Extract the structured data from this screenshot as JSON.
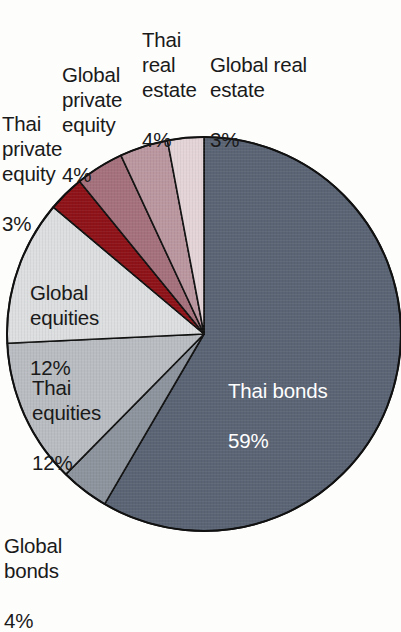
{
  "chart_data": {
    "type": "pie",
    "title": "",
    "subtitle": "",
    "xlabel": "",
    "ylabel": "",
    "legend_position": "none",
    "grid": false,
    "value_unit": "%",
    "start_angle_deg": 0,
    "direction": "clockwise",
    "categories": [
      "Thai bonds",
      "Global bonds",
      "Thai equities",
      "Global equities",
      "Thai private equity",
      "Global private equity",
      "Thai real estate",
      "Global real estate"
    ],
    "values": [
      59,
      4,
      12,
      12,
      3,
      4,
      4,
      3
    ],
    "colors": [
      "#5a6474",
      "#8d949d",
      "#b9bdc1",
      "#dcdedf",
      "#8e1318",
      "#a5717c",
      "#bb97a0",
      "#e4d4d8"
    ],
    "slices": [
      {
        "label": "Thai bonds",
        "value": 59,
        "value_text": "59%",
        "color": "#5a6474"
      },
      {
        "label": "Global bonds",
        "value": 4,
        "value_text": "4%",
        "color": "#8d949d"
      },
      {
        "label": "Thai equities",
        "value": 12,
        "value_text": "12%",
        "color": "#b9bdc1"
      },
      {
        "label": "Global equities",
        "value": 12,
        "value_text": "12%",
        "color": "#dcdedf"
      },
      {
        "label": "Thai private equity",
        "value": 3,
        "value_text": "3%",
        "color": "#8e1318"
      },
      {
        "label": "Global private equity",
        "value": 4,
        "value_text": "4%",
        "color": "#a5717c"
      },
      {
        "label": "Thai real estate",
        "value": 4,
        "value_text": "4%",
        "color": "#bb97a0"
      },
      {
        "label": "Global real estate",
        "value": 3,
        "value_text": "3%",
        "color": "#e4d4d8"
      }
    ]
  },
  "labels": {
    "thai_bonds": {
      "name": "Thai bonds",
      "pct": "59%"
    },
    "global_bonds": {
      "name": "Global\nbonds",
      "pct": "4%"
    },
    "thai_equities": {
      "name": "Thai\nequities",
      "pct": "12%"
    },
    "global_equities": {
      "name": "Global\nequities",
      "pct": "12%"
    },
    "thai_private_equity": {
      "name": "Thai\nprivate\nequity",
      "pct": "3%"
    },
    "global_private_equity": {
      "name": "Global\nprivate\nequity",
      "pct": "4%"
    },
    "thai_real_estate": {
      "name": "Thai\nreal\nestate",
      "pct": "4%"
    },
    "global_real_estate": {
      "name": "Global real\nestate",
      "pct": "3%"
    }
  },
  "style": {
    "stroke": "#111111",
    "background": "#fdfdfc",
    "inside_label_color": "#ffffff",
    "outside_label_color": "#1a1a1a"
  }
}
